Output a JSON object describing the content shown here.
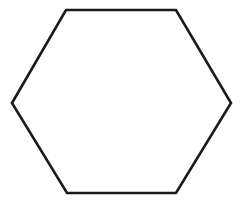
{
  "figure": {
    "canvas": {
      "width": 242,
      "height": 205,
      "background_color": "#ffffff"
    },
    "shape": {
      "name": "hexagon",
      "sides": 6,
      "orientation": "pointy-left-right",
      "fill_color": "#ffffff",
      "filled": false,
      "stroke_color": "#1a1a1a",
      "stroke_width": 2.6,
      "vertex_labels": [
        "left",
        "top-left",
        "top-right",
        "right",
        "bottom-right",
        "bottom-left"
      ],
      "vertices": [
        {
          "x": 12,
          "y": 103
        },
        {
          "x": 66,
          "y": 10
        },
        {
          "x": 176,
          "y": 10
        },
        {
          "x": 231,
          "y": 103
        },
        {
          "x": 176,
          "y": 193
        },
        {
          "x": 67,
          "y": 193
        }
      ],
      "points_attr": "12,103 66,10 176,10 231,103 176,193 67,193",
      "bounding_box": {
        "x": 12,
        "y": 10,
        "width": 219,
        "height": 183
      }
    }
  }
}
